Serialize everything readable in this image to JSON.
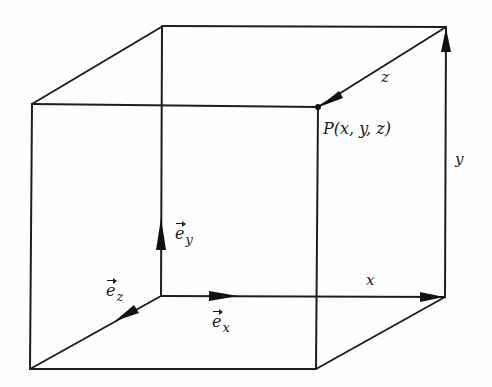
{
  "figure": {
    "colors": {
      "background": "#fefefe",
      "ink": "#1e1e1e"
    }
  },
  "labels": {
    "point": "P(x, y, z)",
    "x_component": "x",
    "y_component": "y",
    "z_component": "z",
    "unit_x": {
      "base": "e",
      "sub": "x"
    },
    "unit_y": {
      "base": "e",
      "sub": "y"
    },
    "unit_z": {
      "base": "e",
      "sub": "z"
    }
  },
  "vertices": {
    "back_top_left": [
      163,
      26
    ],
    "back_top_right": [
      446,
      27
    ],
    "front_top_left": [
      32,
      104
    ],
    "front_top_right_P": [
      318,
      107
    ],
    "back_bottom_left_origin": [
      161,
      296
    ],
    "back_bottom_right": [
      445,
      297
    ],
    "front_bottom_left": [
      30,
      369
    ],
    "front_bottom_right": [
      316,
      369
    ]
  }
}
